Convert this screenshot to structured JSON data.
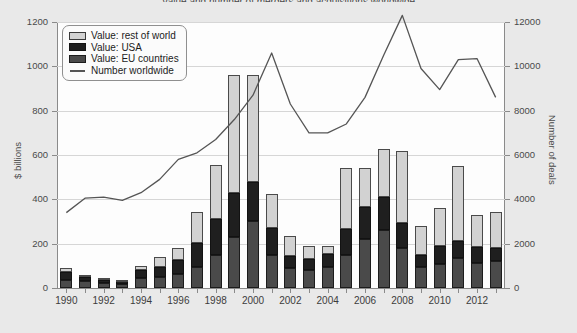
{
  "title": "Value and number of mergers and acquisitions worldwide",
  "axes": {
    "left": {
      "label": "$ billions",
      "ticks": [
        0,
        200,
        400,
        600,
        800,
        1000,
        1200
      ],
      "min": 0,
      "max": 1200
    },
    "right": {
      "label": "Number of deals",
      "ticks": [
        0,
        2000,
        4000,
        6000,
        8000,
        10000,
        12000
      ],
      "min": 0,
      "max": 12000
    },
    "bottom": {
      "label": "",
      "ticks": [
        "1990",
        "1992",
        "1994",
        "1996",
        "1998",
        "2000",
        "2002",
        "2004",
        "2006",
        "2008",
        "2010",
        "2012"
      ]
    }
  },
  "legend": {
    "position": "top-left",
    "items": [
      {
        "label": "Value: rest of world",
        "swatch": "row-sw",
        "icon": "legend-swatch-rest-of-world",
        "color": "#d2d2d2"
      },
      {
        "label": "Value: USA",
        "swatch": "usa-sw",
        "icon": "legend-swatch-usa",
        "color": "#1f1f1f"
      },
      {
        "label": "Value: EU countries",
        "swatch": "eu-sw",
        "icon": "legend-swatch-eu",
        "color": "#4a4a4a"
      },
      {
        "label": "Number worldwide",
        "swatch": "line-sw",
        "icon": "legend-line-number-worldwide",
        "color": "#555555"
      }
    ]
  },
  "chart_data": {
    "type": "bar",
    "title": "Value and number of mergers and acquisitions worldwide",
    "xlabel": "",
    "ylabel": "$ billions",
    "y2label": "Number of deals",
    "ylim": [
      0,
      1200
    ],
    "y2lim": [
      0,
      12000
    ],
    "grid": true,
    "stacked": true,
    "categories": [
      "1990",
      "1991",
      "1992",
      "1993",
      "1994",
      "1995",
      "1996",
      "1997",
      "1998",
      "1999",
      "2000",
      "2001",
      "2002",
      "2003",
      "2004",
      "2005",
      "2006",
      "2007",
      "2008",
      "2009",
      "2010",
      "2011",
      "2012",
      "2013"
    ],
    "series": [
      {
        "name": "Value: EU countries",
        "axis": "left",
        "color": "#4a4a4a",
        "values": [
          35,
          30,
          22,
          18,
          45,
          50,
          62,
          95,
          150,
          230,
          300,
          150,
          90,
          80,
          95,
          150,
          220,
          260,
          180,
          95,
          110,
          135,
          115,
          120
        ]
      },
      {
        "name": "Value: USA",
        "axis": "left",
        "color": "#1f1f1f",
        "values": [
          35,
          20,
          15,
          12,
          35,
          45,
          65,
          110,
          160,
          200,
          180,
          120,
          55,
          50,
          60,
          115,
          145,
          150,
          115,
          55,
          80,
          75,
          70,
          60
        ]
      },
      {
        "name": "Value: rest of world",
        "axis": "left",
        "color": "#d2d2d2",
        "values": [
          20,
          10,
          10,
          8,
          18,
          45,
          55,
          140,
          245,
          530,
          480,
          155,
          90,
          60,
          35,
          275,
          175,
          215,
          325,
          130,
          170,
          340,
          145,
          165
        ]
      },
      {
        "name": "Number worldwide",
        "axis": "right",
        "type": "line",
        "color": "#555555",
        "values": [
          3400,
          4050,
          4100,
          3950,
          4300,
          4900,
          5800,
          6100,
          6700,
          7600,
          8700,
          10600,
          8300,
          7000,
          7000,
          7400,
          8600,
          10500,
          12300,
          9900,
          8950,
          10300,
          10350,
          8600
        ]
      }
    ],
    "annotations": []
  }
}
